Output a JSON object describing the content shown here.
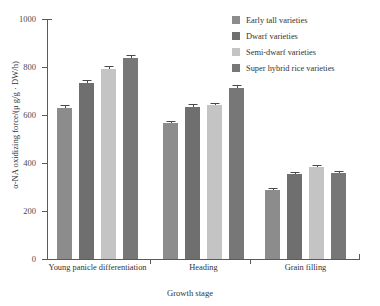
{
  "chart_data": {
    "type": "bar",
    "title": "",
    "xlabel": "Growth stage",
    "ylabel": "α-NA oxidizing force/(μ g/g · DW/h)",
    "categories": [
      "Young panicle differentiation",
      "Heading",
      "Grain filling"
    ],
    "ylim": [
      0,
      1000
    ],
    "yticks": [
      0,
      200,
      400,
      600,
      800,
      1000
    ],
    "grid": false,
    "legend_position": "top-right",
    "series": [
      {
        "name": "Early tall varieties",
        "color": "#8c8c8c",
        "values": [
          629,
          567,
          288
        ],
        "errors": [
          12,
          8,
          10
        ]
      },
      {
        "name": "Dwarf varieties",
        "color": "#6f6f6f",
        "values": [
          733,
          633,
          354
        ],
        "errors": [
          13,
          12,
          9
        ]
      },
      {
        "name": "Semi-dwarf varieties",
        "color": "#c4c4c4",
        "values": [
          792,
          642,
          383
        ],
        "errors": [
          13,
          10,
          9
        ]
      },
      {
        "name": "Super hybrid rice varieties",
        "color": "#777777",
        "values": [
          838,
          713,
          358
        ],
        "errors": [
          14,
          11,
          9
        ]
      }
    ]
  },
  "axis": {
    "y_tick_labels": [
      "1000",
      "800",
      "600",
      "400",
      "200",
      "0"
    ],
    "y_title": "α-NA oxidizing force/(μ g/g · DW/h)",
    "x_title": "Growth stage",
    "x_group_labels": [
      "Young panicle differentiation",
      "Heading",
      "Grain filling"
    ]
  },
  "legend": {
    "items": [
      {
        "label": "Early tall varieties",
        "color": "#8c8c8c"
      },
      {
        "label": "Dwarf varieties",
        "color": "#6f6f6f"
      },
      {
        "label": "Semi-dwarf varieties",
        "color": "#c4c4c4"
      },
      {
        "label": "Super hybrid rice varieties",
        "color": "#777777"
      }
    ]
  }
}
